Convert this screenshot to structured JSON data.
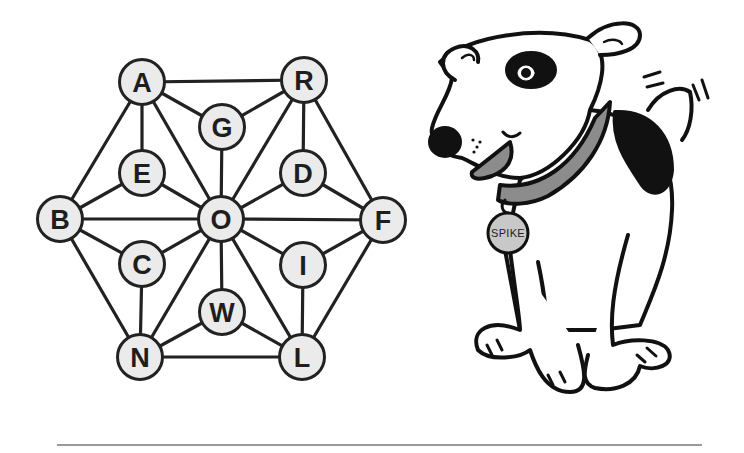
{
  "puzzle": {
    "type": "letter-graph",
    "colors": {
      "node_fill": "#ebebeb",
      "stroke": "#222222",
      "text": "#1e1e1e"
    },
    "nodes": [
      {
        "id": "A",
        "label": "A",
        "x": 142,
        "y": 82
      },
      {
        "id": "R",
        "label": "R",
        "x": 304,
        "y": 80
      },
      {
        "id": "G",
        "label": "G",
        "x": 222,
        "y": 127
      },
      {
        "id": "E",
        "label": "E",
        "x": 142,
        "y": 173
      },
      {
        "id": "D",
        "label": "D",
        "x": 303,
        "y": 173
      },
      {
        "id": "B",
        "label": "B",
        "x": 60,
        "y": 219
      },
      {
        "id": "O",
        "label": "O",
        "x": 221,
        "y": 219
      },
      {
        "id": "F",
        "label": "F",
        "x": 383,
        "y": 220
      },
      {
        "id": "C",
        "label": "C",
        "x": 142,
        "y": 264
      },
      {
        "id": "I",
        "label": "I",
        "x": 303,
        "y": 265
      },
      {
        "id": "W",
        "label": "W",
        "x": 222,
        "y": 312
      },
      {
        "id": "N",
        "label": "N",
        "x": 140,
        "y": 357
      },
      {
        "id": "L",
        "label": "L",
        "x": 302,
        "y": 357
      }
    ],
    "edges": [
      [
        "A",
        "R"
      ],
      [
        "A",
        "G"
      ],
      [
        "G",
        "R"
      ],
      [
        "A",
        "E"
      ],
      [
        "A",
        "B"
      ],
      [
        "A",
        "O"
      ],
      [
        "G",
        "O"
      ],
      [
        "R",
        "O"
      ],
      [
        "R",
        "D"
      ],
      [
        "R",
        "F"
      ],
      [
        "E",
        "B"
      ],
      [
        "E",
        "O"
      ],
      [
        "D",
        "O"
      ],
      [
        "D",
        "F"
      ],
      [
        "B",
        "O"
      ],
      [
        "O",
        "F"
      ],
      [
        "B",
        "C"
      ],
      [
        "B",
        "N"
      ],
      [
        "C",
        "O"
      ],
      [
        "C",
        "N"
      ],
      [
        "O",
        "N"
      ],
      [
        "O",
        "W"
      ],
      [
        "O",
        "L"
      ],
      [
        "O",
        "I"
      ],
      [
        "I",
        "F"
      ],
      [
        "I",
        "L"
      ],
      [
        "F",
        "L"
      ],
      [
        "W",
        "N"
      ],
      [
        "W",
        "L"
      ],
      [
        "N",
        "L"
      ]
    ]
  },
  "illustration": {
    "subject": "cartoon dog",
    "tag_text": "SPIKE",
    "colors": {
      "outline": "#111111",
      "collar": "#8c8c8c",
      "tag": "#c8c8c8",
      "tongue": "#8c8c8c",
      "spot": "#111111"
    }
  }
}
